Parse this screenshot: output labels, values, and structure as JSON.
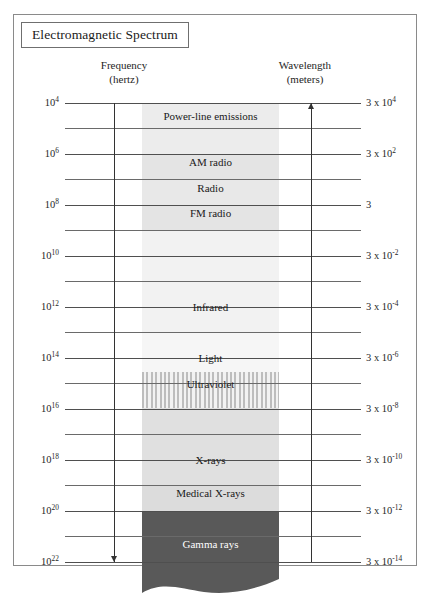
{
  "figure": {
    "title": "Electromagnetic Spectrum"
  },
  "axes": {
    "left": {
      "name": "Frequency",
      "unit": "(hertz)",
      "direction": "increasing-downward"
    },
    "right": {
      "name": "Wavelength",
      "unit": "(meters)",
      "direction": "increasing-upward"
    }
  },
  "chart_data": {
    "type": "bar",
    "title": "Electromagnetic Spectrum",
    "xlabel": "",
    "ylabel": "Frequency (hertz)",
    "y2label": "Wavelength (meters)",
    "grid": true,
    "legend": "none",
    "orientation": "vertical-log-scale",
    "axis_left": {
      "label": "Frequency",
      "unit": "hertz",
      "arrow": "down",
      "major_ticks": [
        {
          "text": "10",
          "exp": "4",
          "value": 10000.0,
          "y": 88
        },
        {
          "text": "10",
          "exp": "6",
          "value": 1000000.0,
          "y": 139
        },
        {
          "text": "10",
          "exp": "8",
          "value": 100000000.0,
          "y": 190
        },
        {
          "text": "10",
          "exp": "10",
          "value": 10000000000.0,
          "y": 241
        },
        {
          "text": "10",
          "exp": "12",
          "value": 1000000000000.0,
          "y": 292
        },
        {
          "text": "10",
          "exp": "14",
          "value": 100000000000000.0,
          "y": 343
        },
        {
          "text": "10",
          "exp": "16",
          "value": 1e+16,
          "y": 394
        },
        {
          "text": "10",
          "exp": "18",
          "value": 1e+18,
          "y": 445
        },
        {
          "text": "10",
          "exp": "20",
          "value": 1e+20,
          "y": 496
        },
        {
          "text": "10",
          "exp": "22",
          "value": 1e+22,
          "y": 547
        }
      ]
    },
    "axis_right": {
      "label": "Wavelength",
      "unit": "meters",
      "arrow": "up",
      "major_ticks": [
        {
          "text": "3 x 10",
          "exp": "4",
          "value": 30000,
          "y": 88
        },
        {
          "text": "3 x 10",
          "exp": "2",
          "value": 300,
          "y": 139
        },
        {
          "text": "3",
          "exp": "",
          "value": 3,
          "y": 190
        },
        {
          "text": "3 x 10",
          "exp": "-2",
          "value": 0.03,
          "y": 241
        },
        {
          "text": "3 x 10",
          "exp": "-4",
          "value": 0.0003,
          "y": 292
        },
        {
          "text": "3 x 10",
          "exp": "-6",
          "value": 3e-06,
          "y": 343
        },
        {
          "text": "3 x 10",
          "exp": "-8",
          "value": 3e-08,
          "y": 394
        },
        {
          "text": "3 x 10",
          "exp": "-10",
          "value": 3e-10,
          "y": 445
        },
        {
          "text": "3 x 10",
          "exp": "-12",
          "value": 3e-12,
          "y": 496
        },
        {
          "text": "3 x 10",
          "exp": "-14",
          "value": 3e-14,
          "y": 547
        }
      ]
    },
    "minor_gridlines_y": [
      113,
      164,
      215,
      266,
      317,
      368,
      419,
      470,
      521
    ],
    "bands": [
      {
        "name": "Power-line emissions",
        "label": "Power-line emissions",
        "top": 88,
        "bottom": 139,
        "label_y": 101,
        "fill": "#ececec",
        "text": "dark"
      },
      {
        "name": "AM radio",
        "label": "AM radio",
        "top": 139,
        "bottom": 164,
        "label_y": 147,
        "fill": "#e4e4e4",
        "text": "dark"
      },
      {
        "name": "Radio",
        "label": "Radio",
        "top": 164,
        "bottom": 190,
        "label_y": 173,
        "fill": "#e8e8e8",
        "text": "dark"
      },
      {
        "name": "FM radio",
        "label": "FM radio",
        "top": 190,
        "bottom": 215,
        "label_y": 198,
        "fill": "#e4e4e4",
        "text": "dark"
      },
      {
        "name": "Infrared",
        "label": "Infrared",
        "top": 215,
        "bottom": 317,
        "label_y": 292,
        "fill": "#f2f2f2",
        "text": "dark"
      },
      {
        "name": "Light",
        "label": "Light",
        "top": 317,
        "bottom": 357,
        "label_y": 343,
        "fill": "#f6f6f6",
        "text": "dark"
      },
      {
        "name": "Ultraviolet",
        "label": "Ultraviolet",
        "top": 357,
        "bottom": 393,
        "label_y": 369,
        "fill": "stripes",
        "text": "dark"
      },
      {
        "name": "X-rays",
        "label": "X-rays",
        "top": 393,
        "bottom": 470,
        "label_y": 445,
        "fill": "#e0e0e0",
        "text": "dark"
      },
      {
        "name": "Medical X-rays",
        "label": "Medical X-rays",
        "top": 470,
        "bottom": 496,
        "label_y": 478,
        "fill": "#dcdcdc",
        "text": "dark"
      },
      {
        "name": "Gamma rays",
        "label": "Gamma rays",
        "top": 496,
        "bottom": 560,
        "label_y": 529,
        "fill": "#595959",
        "text": "light"
      }
    ],
    "band_x_left": 128,
    "band_x_right": 265
  }
}
